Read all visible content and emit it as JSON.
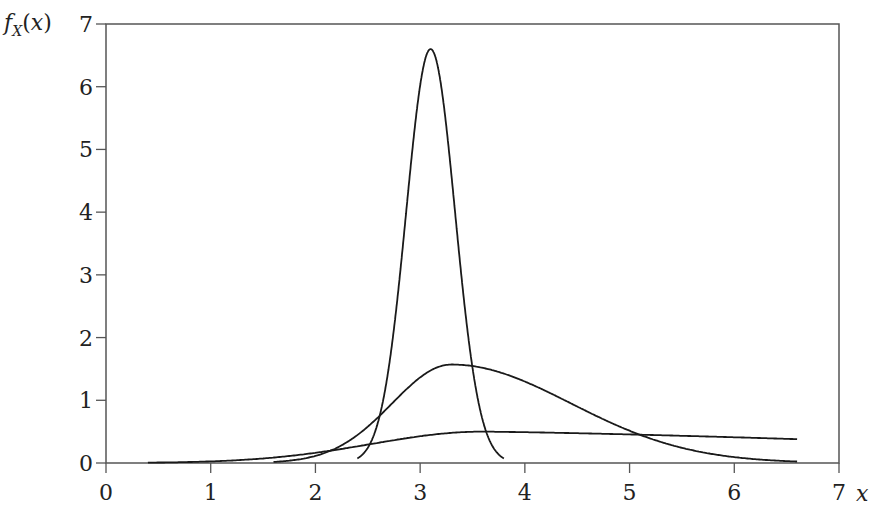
{
  "chart_data": {
    "type": "line",
    "title": "",
    "xlabel": "x",
    "ylabel": "f_X(x)",
    "ylabel_main": "f",
    "ylabel_sub": "X",
    "ylabel_arg": "(x)",
    "xlim": [
      0,
      7
    ],
    "ylim": [
      0,
      7
    ],
    "grid": false,
    "legend": null,
    "x_ticks": [
      0,
      1,
      2,
      3,
      4,
      5,
      6,
      7
    ],
    "y_ticks": [
      0,
      1,
      2,
      3,
      4,
      5,
      6,
      7
    ],
    "series": [
      {
        "name": "narrow density",
        "description": "sharp peak near x=3.1, max ≈ 6.6",
        "peak_x": 3.1,
        "peak_y": 6.6,
        "x_start": 2.4,
        "x_end": 3.8,
        "lognormal": {
          "mu": 1.134,
          "sigma": 0.0195
        }
      },
      {
        "name": "medium density",
        "description": "moderate peak near x=3.3, max ≈ 1.57",
        "peak_x": 3.3,
        "peak_y": 1.57,
        "x_start": 1.6,
        "x_end": 6.6,
        "lognormal": {
          "mu": 1.25,
          "sigma": 0.0765
        }
      },
      {
        "name": "wide density",
        "description": "broad flat curve, max ≈ 0.5 near x=3.6",
        "peak_x": 3.6,
        "peak_y": 0.5,
        "x_start": 0.4,
        "x_end": 6.6,
        "lognormal": {
          "mu": 1.6,
          "sigma": 0.35
        }
      }
    ],
    "color": "#1a1a1a"
  }
}
